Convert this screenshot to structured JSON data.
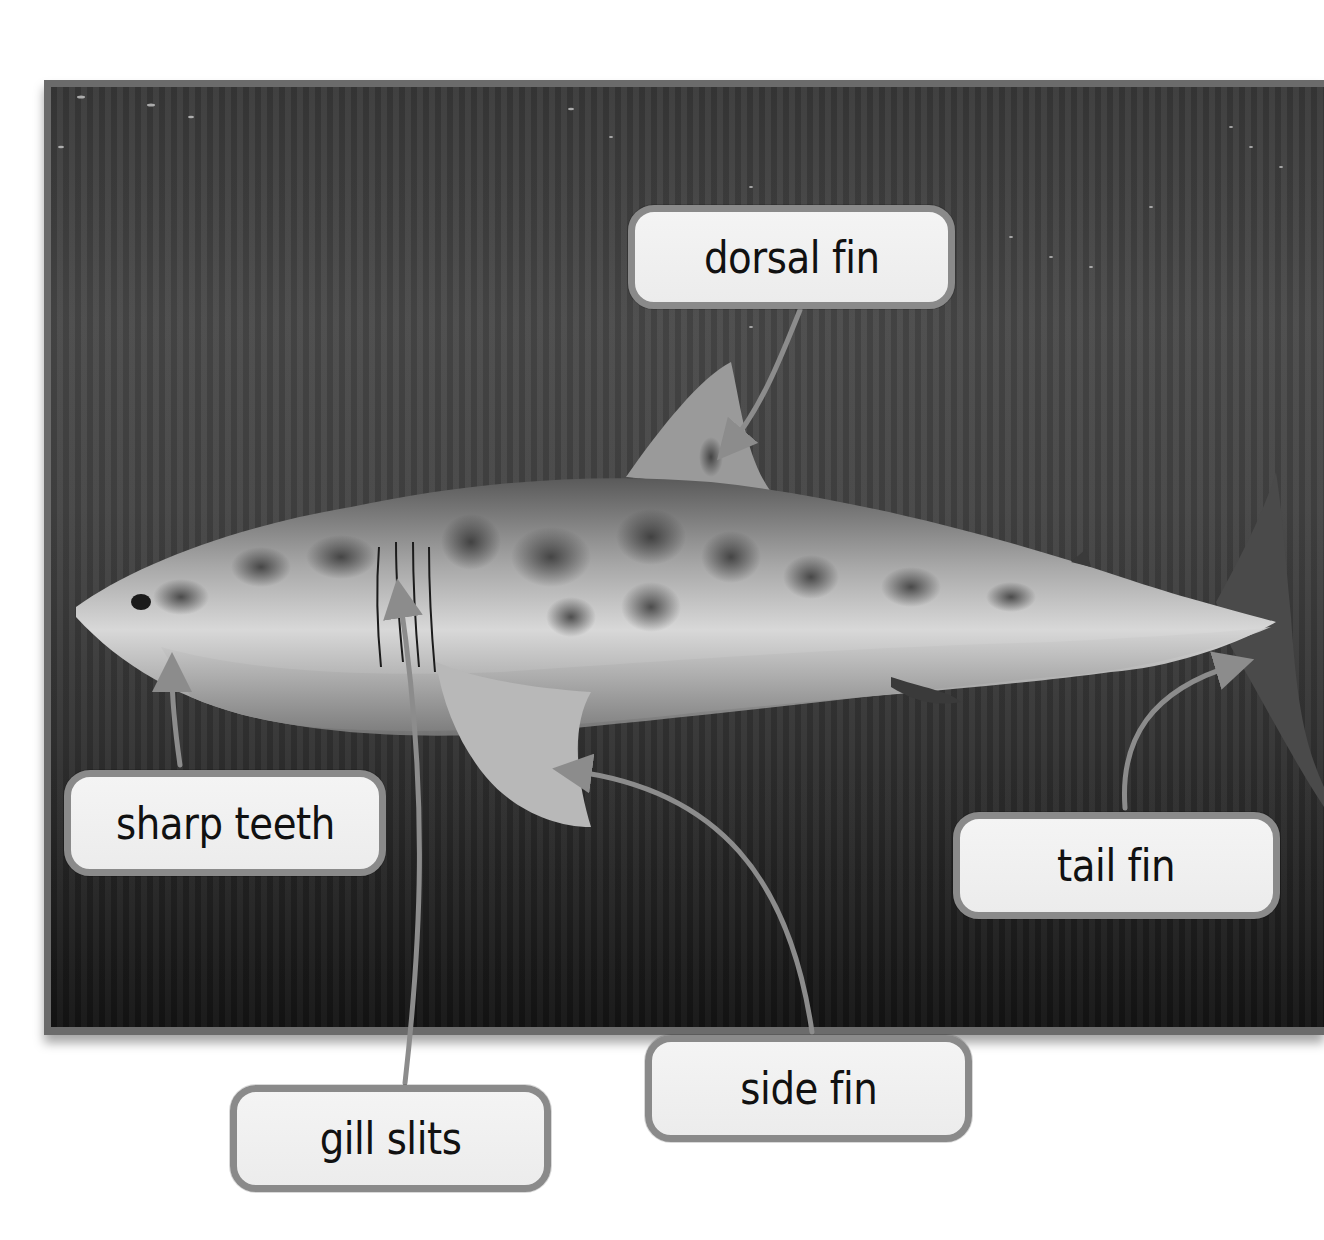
{
  "figure": {
    "image_style": "grayscale underwater photograph",
    "colors": {
      "frame": "#6b6b6b",
      "label_fill": "#eeeeee",
      "label_border": "#8a8a8a",
      "arrow": "#8c8c8c",
      "text": "#111111"
    }
  },
  "labels": [
    {
      "id": "dorsal_fin",
      "text": "dorsal fin"
    },
    {
      "id": "sharp_teeth",
      "text": "sharp teeth"
    },
    {
      "id": "tail_fin",
      "text": "tail fin"
    },
    {
      "id": "gill_slits",
      "text": "gill slits"
    },
    {
      "id": "side_fin",
      "text": "side fin"
    }
  ]
}
